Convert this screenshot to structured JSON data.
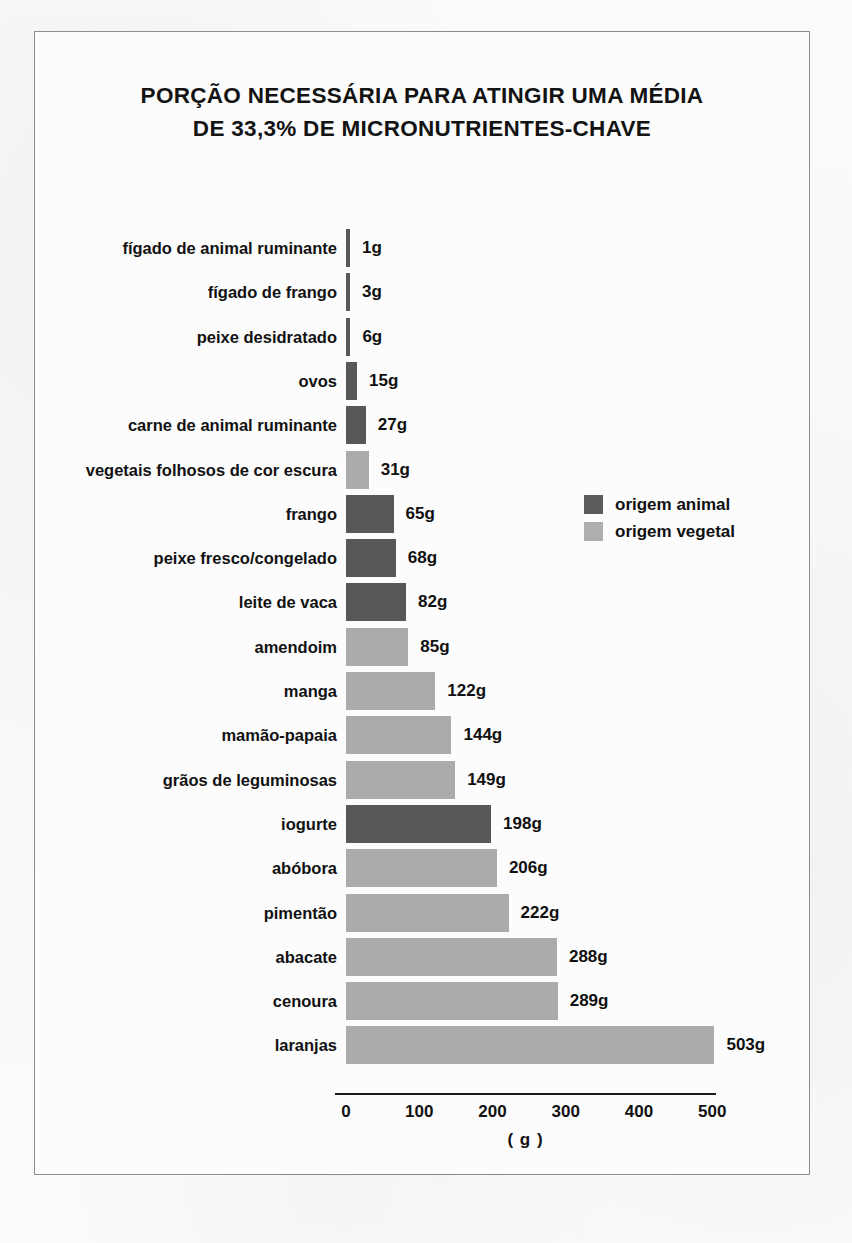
{
  "chart_data": {
    "type": "bar",
    "orientation": "horizontal",
    "title": "PORÇÃO NECESSÁRIA PARA ATINGIR UMA MÉDIA DE 33,3% DE MICRONUTRIENTES-CHAVE",
    "title_line1": "PORÇÃO NECESSÁRIA PARA ATINGIR UMA MÉDIA",
    "title_line2": "DE 33,3% DE MICRONUTRIENTES-CHAVE",
    "xlabel": "( g )",
    "ylabel": "",
    "xlim": [
      0,
      520
    ],
    "xticks": [
      0,
      100,
      200,
      300,
      400,
      500
    ],
    "xtick_labels": [
      "0",
      "100",
      "200",
      "300",
      "400",
      "500"
    ],
    "grid": false,
    "unit_suffix": "g",
    "legend_position": "right-middle",
    "legend": [
      {
        "key": "animal",
        "label": "origem animal",
        "color": "#585858"
      },
      {
        "key": "vegetal",
        "label": "origem vegetal",
        "color": "#ababab"
      }
    ],
    "categories": [
      "fígado de animal ruminante",
      "fígado de frango",
      "peixe desidratado",
      "ovos",
      "carne de animal ruminante",
      "vegetais folhosos de cor escura",
      "frango",
      "peixe fresco/congelado",
      "leite de vaca",
      "amendoim",
      "manga",
      "mamão-papaia",
      "grãos de leguminosas",
      "iogurte",
      "abóbora",
      "pimentão",
      "abacate",
      "cenoura",
      "laranjas"
    ],
    "values": [
      1,
      3,
      6,
      15,
      27,
      31,
      65,
      68,
      82,
      85,
      122,
      144,
      149,
      198,
      206,
      222,
      288,
      289,
      503
    ],
    "value_labels": [
      "1g",
      "3g",
      "6g",
      "15g",
      "27g",
      "31g",
      "65g",
      "68g",
      "82g",
      "85g",
      "122g",
      "144g",
      "149g",
      "198g",
      "206g",
      "222g",
      "288g",
      "289g",
      "503g"
    ],
    "origins": [
      "animal",
      "animal",
      "animal",
      "animal",
      "animal",
      "vegetal",
      "animal",
      "animal",
      "animal",
      "vegetal",
      "vegetal",
      "vegetal",
      "vegetal",
      "animal",
      "vegetal",
      "vegetal",
      "vegetal",
      "vegetal",
      "vegetal"
    ],
    "bars": [
      {
        "label": "fígado de animal ruminante",
        "value": 1,
        "value_label": "1g",
        "origin": "animal"
      },
      {
        "label": "fígado de frango",
        "value": 3,
        "value_label": "3g",
        "origin": "animal"
      },
      {
        "label": "peixe desidratado",
        "value": 6,
        "value_label": "6g",
        "origin": "animal"
      },
      {
        "label": "ovos",
        "value": 15,
        "value_label": "15g",
        "origin": "animal"
      },
      {
        "label": "carne de animal ruminante",
        "value": 27,
        "value_label": "27g",
        "origin": "animal"
      },
      {
        "label": "vegetais folhosos de cor escura",
        "value": 31,
        "value_label": "31g",
        "origin": "vegetal"
      },
      {
        "label": "frango",
        "value": 65,
        "value_label": "65g",
        "origin": "animal"
      },
      {
        "label": "peixe fresco/congelado",
        "value": 68,
        "value_label": "68g",
        "origin": "animal"
      },
      {
        "label": "leite de vaca",
        "value": 82,
        "value_label": "82g",
        "origin": "animal"
      },
      {
        "label": "amendoim",
        "value": 85,
        "value_label": "85g",
        "origin": "vegetal"
      },
      {
        "label": "manga",
        "value": 122,
        "value_label": "122g",
        "origin": "vegetal"
      },
      {
        "label": "mamão-papaia",
        "value": 144,
        "value_label": "144g",
        "origin": "vegetal"
      },
      {
        "label": "grãos de leguminosas",
        "value": 149,
        "value_label": "149g",
        "origin": "vegetal"
      },
      {
        "label": "iogurte",
        "value": 198,
        "value_label": "198g",
        "origin": "animal"
      },
      {
        "label": "abóbora",
        "value": 206,
        "value_label": "206g",
        "origin": "vegetal"
      },
      {
        "label": "pimentão",
        "value": 222,
        "value_label": "222g",
        "origin": "vegetal"
      },
      {
        "label": "abacate",
        "value": 288,
        "value_label": "288g",
        "origin": "vegetal"
      },
      {
        "label": "cenoura",
        "value": 289,
        "value_label": "289g",
        "origin": "vegetal"
      },
      {
        "label": "laranjas",
        "value": 503,
        "value_label": "503g",
        "origin": "vegetal"
      }
    ]
  }
}
